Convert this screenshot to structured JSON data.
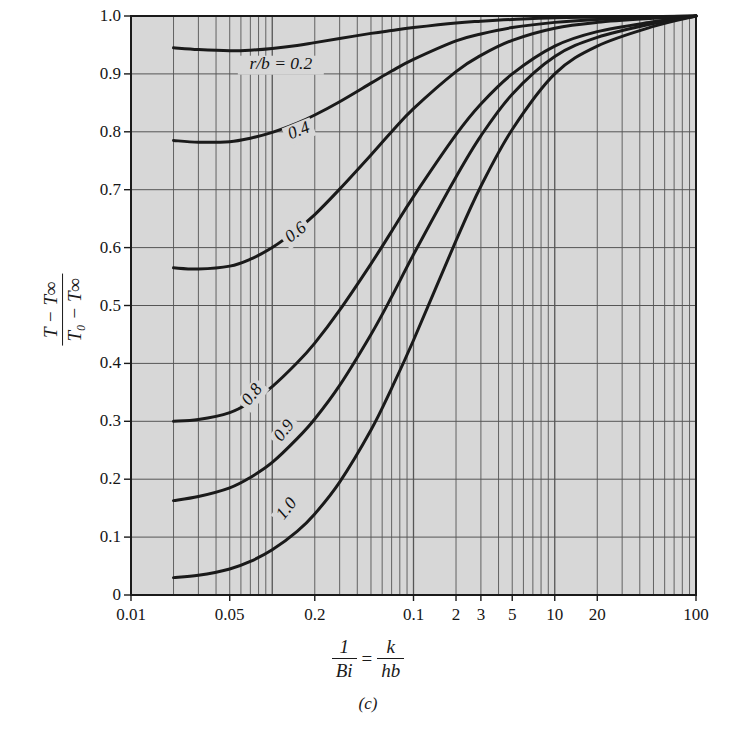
{
  "figure": {
    "panel_caption": "(c)",
    "background_color": "#ffffff",
    "plot_fill_color": "#d7d7d7",
    "grid_color": "#555555",
    "curve_color": "#1a1a1a",
    "axis_color": "#1a1a1a"
  },
  "axis": {
    "y_title_numerator": "T − T∞",
    "y_title_denominator": "T₀ − T∞",
    "x_title_left_numerator": "1",
    "x_title_left_denominator": "Bi",
    "x_title_equals": "=",
    "x_title_right_numerator": "k",
    "x_title_right_denominator": "hb",
    "x_scale": "log",
    "x_min": 0.01,
    "x_max": 100,
    "y_min": 0,
    "y_max": 1.0,
    "x_tick_labels": [
      "0.01",
      "0.05",
      "0.2",
      "0.1",
      "2",
      "3",
      "5",
      "10",
      "20",
      "100"
    ],
    "x_tick_values": [
      0.01,
      0.05,
      0.2,
      1.0,
      2,
      3,
      5,
      10,
      20,
      100
    ],
    "y_tick_labels": [
      "0",
      "0.1",
      "0.2",
      "0.3",
      "0.4",
      "0.5",
      "0.6",
      "0.7",
      "0.8",
      "0.9",
      "1.0"
    ],
    "y_tick_values": [
      0,
      0.1,
      0.2,
      0.3,
      0.4,
      0.5,
      0.6,
      0.7,
      0.8,
      0.9,
      1.0
    ]
  },
  "chart_data": {
    "type": "line",
    "title": "",
    "subtitle": "(c)",
    "xlabel": "1/Bi = k/hb",
    "ylabel": "(T - Tinf)/(T0 - Tinf)",
    "xscale": "log",
    "xlim": [
      0.01,
      100
    ],
    "ylim": [
      0,
      1.0
    ],
    "grid": true,
    "legend": "inline-curve-labels",
    "series": [
      {
        "name": "r/b = 0.2",
        "label": "r/b = 0.2",
        "label_x": 0.115,
        "label_y": 0.915,
        "points": [
          [
            0.02,
            0.945
          ],
          [
            0.03,
            0.942
          ],
          [
            0.05,
            0.94
          ],
          [
            0.07,
            0.941
          ],
          [
            0.1,
            0.944
          ],
          [
            0.15,
            0.949
          ],
          [
            0.2,
            0.954
          ],
          [
            0.3,
            0.961
          ],
          [
            0.5,
            0.97
          ],
          [
            0.7,
            0.975
          ],
          [
            1.0,
            0.98
          ],
          [
            2.0,
            0.988
          ],
          [
            3.0,
            0.991
          ],
          [
            5.0,
            0.994
          ],
          [
            10,
            0.997
          ],
          [
            20,
            0.998
          ],
          [
            50,
            0.999
          ],
          [
            100,
            1.0
          ]
        ]
      },
      {
        "name": "r/b = 0.4",
        "label": "0.4",
        "label_x": 0.155,
        "label_y": 0.8,
        "points": [
          [
            0.02,
            0.785
          ],
          [
            0.03,
            0.782
          ],
          [
            0.05,
            0.783
          ],
          [
            0.07,
            0.789
          ],
          [
            0.1,
            0.799
          ],
          [
            0.15,
            0.815
          ],
          [
            0.2,
            0.829
          ],
          [
            0.3,
            0.852
          ],
          [
            0.5,
            0.884
          ],
          [
            0.7,
            0.905
          ],
          [
            1.0,
            0.925
          ],
          [
            2.0,
            0.957
          ],
          [
            3.0,
            0.969
          ],
          [
            5.0,
            0.98
          ],
          [
            10,
            0.989
          ],
          [
            20,
            0.994
          ],
          [
            50,
            0.998
          ],
          [
            100,
            1.0
          ]
        ]
      },
      {
        "name": "r/b = 0.6",
        "label": "0.6",
        "label_x": 0.148,
        "label_y": 0.625,
        "points": [
          [
            0.02,
            0.565
          ],
          [
            0.03,
            0.563
          ],
          [
            0.05,
            0.568
          ],
          [
            0.07,
            0.58
          ],
          [
            0.1,
            0.6
          ],
          [
            0.15,
            0.631
          ],
          [
            0.2,
            0.657
          ],
          [
            0.3,
            0.701
          ],
          [
            0.5,
            0.76
          ],
          [
            0.7,
            0.8
          ],
          [
            1.0,
            0.84
          ],
          [
            2.0,
            0.904
          ],
          [
            3.0,
            0.932
          ],
          [
            5.0,
            0.958
          ],
          [
            10,
            0.979
          ],
          [
            20,
            0.989
          ],
          [
            50,
            0.996
          ],
          [
            100,
            1.0
          ]
        ]
      },
      {
        "name": "r/b = 0.8",
        "label": "0.8",
        "label_x": 0.073,
        "label_y": 0.345,
        "points": [
          [
            0.02,
            0.3
          ],
          [
            0.03,
            0.303
          ],
          [
            0.05,
            0.315
          ],
          [
            0.07,
            0.333
          ],
          [
            0.1,
            0.36
          ],
          [
            0.15,
            0.401
          ],
          [
            0.2,
            0.435
          ],
          [
            0.3,
            0.492
          ],
          [
            0.5,
            0.572
          ],
          [
            0.7,
            0.628
          ],
          [
            1.0,
            0.688
          ],
          [
            2.0,
            0.795
          ],
          [
            3.0,
            0.848
          ],
          [
            5.0,
            0.9
          ],
          [
            10,
            0.948
          ],
          [
            20,
            0.973
          ],
          [
            50,
            0.99
          ],
          [
            100,
            1.0
          ]
        ]
      },
      {
        "name": "r/b = 0.9",
        "label": "0.9",
        "label_x": 0.123,
        "label_y": 0.283,
        "points": [
          [
            0.02,
            0.163
          ],
          [
            0.03,
            0.17
          ],
          [
            0.05,
            0.185
          ],
          [
            0.07,
            0.203
          ],
          [
            0.1,
            0.229
          ],
          [
            0.15,
            0.27
          ],
          [
            0.2,
            0.304
          ],
          [
            0.3,
            0.362
          ],
          [
            0.5,
            0.45
          ],
          [
            0.7,
            0.515
          ],
          [
            1.0,
            0.588
          ],
          [
            2.0,
            0.722
          ],
          [
            3.0,
            0.793
          ],
          [
            5.0,
            0.865
          ],
          [
            10,
            0.93
          ],
          [
            20,
            0.963
          ],
          [
            50,
            0.987
          ],
          [
            100,
            1.0
          ]
        ]
      },
      {
        "name": "r/b = 1.0",
        "label": "1.0",
        "label_x": 0.128,
        "label_y": 0.148,
        "points": [
          [
            0.02,
            0.03
          ],
          [
            0.03,
            0.034
          ],
          [
            0.05,
            0.045
          ],
          [
            0.07,
            0.058
          ],
          [
            0.1,
            0.078
          ],
          [
            0.15,
            0.11
          ],
          [
            0.2,
            0.14
          ],
          [
            0.3,
            0.195
          ],
          [
            0.5,
            0.285
          ],
          [
            0.7,
            0.357
          ],
          [
            1.0,
            0.44
          ],
          [
            2.0,
            0.612
          ],
          [
            3.0,
            0.706
          ],
          [
            5.0,
            0.804
          ],
          [
            10,
            0.9
          ],
          [
            20,
            0.948
          ],
          [
            50,
            0.982
          ],
          [
            100,
            1.0
          ]
        ]
      }
    ]
  }
}
